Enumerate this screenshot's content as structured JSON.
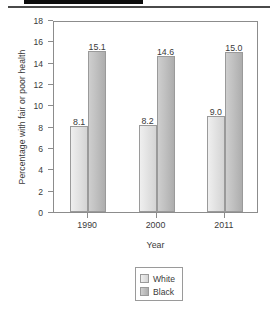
{
  "header": {
    "redaction_present": true
  },
  "chart_data": {
    "type": "bar",
    "title": "",
    "categories": [
      "1990",
      "2000",
      "2011"
    ],
    "series": [
      {
        "name": "White",
        "values": [
          8.1,
          8.2,
          9.0
        ],
        "color": "#e3e3e3"
      },
      {
        "name": "Black",
        "values": [
          15.1,
          14.6,
          15.0
        ],
        "color": "#c0c0c0"
      }
    ],
    "value_labels": [
      [
        "8.1",
        "15.1"
      ],
      [
        "8.2",
        "14.6"
      ],
      [
        "9.0",
        "15.0"
      ]
    ],
    "xlabel": "Year",
    "ylabel": "Percentage with fair or poor health",
    "ylim": [
      0,
      18
    ],
    "yticks": [
      "0",
      "2",
      "4",
      "6",
      "8",
      "10",
      "12",
      "14",
      "16",
      "18"
    ],
    "grid": false,
    "legend_position": "bottom-center"
  },
  "legend": {
    "entries": [
      {
        "label": "White"
      },
      {
        "label": "Black"
      }
    ]
  }
}
